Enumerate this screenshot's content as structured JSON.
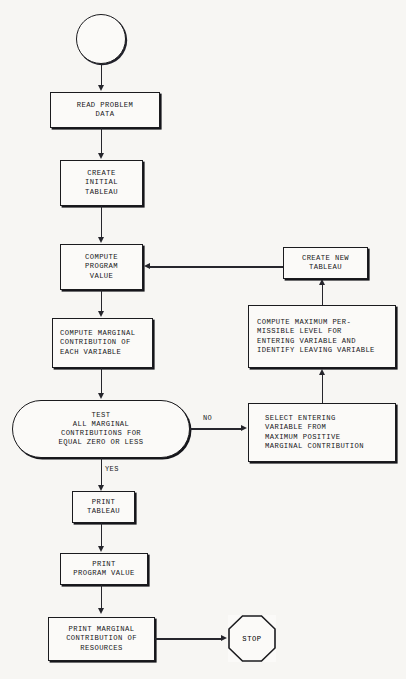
{
  "diagram": {
    "background_color": "#f7f6f3",
    "line_color": "#26262c",
    "node_fill": "#fbfaf8",
    "text_color": "#17171a"
  },
  "nodes": {
    "start": {
      "label": "",
      "shape": "circle"
    },
    "read_problem_data": {
      "label": "READ PROBLEM\nDATA",
      "shape": "process"
    },
    "create_initial_tableau": {
      "label": "CREATE\nINITIAL\nTABLEAU",
      "shape": "process"
    },
    "compute_program_value": {
      "label": "COMPUTE\nPROGRAM\nVALUE",
      "shape": "process"
    },
    "compute_marginal_contribution": {
      "label": "COMPUTE MARGINAL\nCONTRIBUTION OF\nEACH VARIABLE",
      "shape": "process"
    },
    "test_decision": {
      "label": "TEST\nALL MARGINAL\nCONTRIBUTIONS FOR\nEQUAL ZERO OR LESS",
      "shape": "decision"
    },
    "print_tableau": {
      "label": "PRINT\nTABLEAU",
      "shape": "process"
    },
    "print_program_value": {
      "label": "PRINT\nPROGRAM VALUE",
      "shape": "process"
    },
    "print_marginal_contribution": {
      "label": "PRINT MARGINAL\nCONTRIBUTION OF\nRESOURCES",
      "shape": "process"
    },
    "stop": {
      "label": "STOP",
      "shape": "octagon"
    },
    "select_entering_variable": {
      "label": "SELECT ENTERING\nVARIABLE FROM\nMAXIMUM POSITIVE\nMARGINAL CONTRIBUTION",
      "shape": "process"
    },
    "compute_maximum_level": {
      "label": "COMPUTE MAXIMUM PER-\nMISSIBLE LEVEL FOR\nENTERING VARIABLE AND\nIDENTIFY LEAVING VARIABLE",
      "shape": "process"
    },
    "create_new_tableau": {
      "label": "CREATE NEW\nTABLEAU",
      "shape": "process"
    }
  },
  "edge_labels": {
    "no": "NO",
    "yes": "YES"
  }
}
